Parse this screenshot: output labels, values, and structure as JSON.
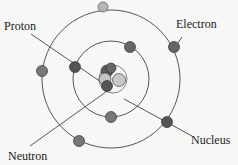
{
  "diagram": {
    "labels": {
      "proton": "Proton",
      "electron": "Electron",
      "nucleus": "Nucleus",
      "neutron": "Neutron"
    },
    "colors": {
      "orbit": "#555555",
      "electron": "#6e6e6e",
      "proton": "#5a5a5a",
      "neutron": "#bdbdbd",
      "leader": "#444444",
      "background": "#f7f7f5"
    },
    "orbits": [
      {
        "name": "outer-orbit",
        "cx": 111,
        "cy": 79,
        "r": 69
      },
      {
        "name": "middle-orbit",
        "cx": 111,
        "cy": 79,
        "r": 38
      },
      {
        "name": "nucleus-boundary",
        "cx": 113,
        "cy": 79,
        "r": 14
      }
    ],
    "electrons": [
      {
        "cx": 103,
        "cy": 7,
        "shade": "light"
      },
      {
        "cx": 174,
        "cy": 47
      },
      {
        "cx": 42,
        "cy": 71
      },
      {
        "cx": 79,
        "cy": 141
      },
      {
        "cx": 167,
        "cy": 122
      },
      {
        "cx": 130,
        "cy": 47
      },
      {
        "cx": 75,
        "cy": 67
      },
      {
        "cx": 111,
        "cy": 117
      }
    ]
  }
}
